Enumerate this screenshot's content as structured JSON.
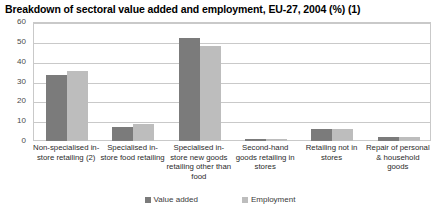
{
  "chart_data": {
    "type": "bar",
    "title": "Breakdown of sectoral value added and employment, EU-27, 2004 (%) (1)",
    "xlabel": "",
    "ylabel": "",
    "ylim": [
      0,
      60
    ],
    "yticks": [
      60,
      50,
      40,
      30,
      20,
      10,
      0
    ],
    "grid": true,
    "legend_position": "bottom",
    "categories": [
      "Non-specialised in-store retailing (2)",
      "Specialised in-store food retailing",
      "Specialised in-store new goods retailing other than food",
      "Second-hand goods retailing in stores",
      "Retailing not in stores",
      "Repair of personal & household goods"
    ],
    "series": [
      {
        "name": "Value added",
        "color": "#7b7b7b",
        "values": [
          33.5,
          7.0,
          52.0,
          1.0,
          6.0,
          2.0
        ]
      },
      {
        "name": "Employment",
        "color": "#bdbdbd",
        "values": [
          35.5,
          8.5,
          48.0,
          1.0,
          6.0,
          2.0
        ]
      }
    ]
  }
}
